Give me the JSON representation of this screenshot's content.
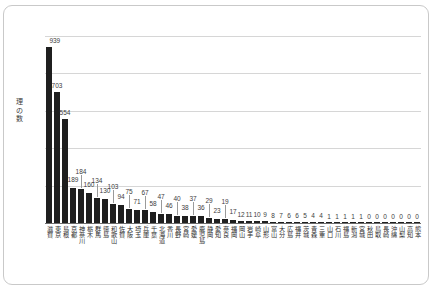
{
  "chart_data": {
    "type": "bar",
    "title": "",
    "subtitle": "",
    "xlabel": "",
    "ylabel": "理の数",
    "ylim": [
      0,
      1000
    ],
    "yticks": [
      0,
      200,
      400,
      600,
      800,
      1000
    ],
    "grid": true,
    "legend": null,
    "bar_color": "#1f1f1f",
    "categories": [
      "滋賀",
      "東京",
      "島根",
      "京都",
      "神奈川",
      "栃木",
      "群馬",
      "徳島",
      "和歌山",
      "佐賀",
      "大阪",
      "埼玉",
      "兵庫",
      "千葉",
      "北海道",
      "香川",
      "長野",
      "宮崎",
      "愛媛",
      "鹿児島",
      "静岡",
      "愛知",
      "奈良",
      "福岡",
      "岡山",
      "岩手",
      "崎阜",
      "山形",
      "富山",
      "大分",
      "広島",
      "福井",
      "茨城",
      "青森",
      "三重",
      "山口",
      "石川",
      "福島",
      "新潟",
      "宮城",
      "秋田",
      "鳥取",
      "長崎",
      "沖縄",
      "山梨",
      "高知",
      "熊本"
    ],
    "values": [
      939,
      703,
      554,
      189,
      184,
      160,
      134,
      130,
      103,
      94,
      75,
      71,
      67,
      58,
      47,
      46,
      40,
      38,
      37,
      36,
      29,
      23,
      19,
      17,
      12,
      11,
      10,
      9,
      8,
      7,
      6,
      6,
      5,
      4,
      4,
      1,
      1,
      1,
      1,
      1,
      0,
      0,
      0,
      0,
      0,
      0,
      0
    ],
    "value_labels": [
      "939",
      "703",
      "554",
      "189",
      "184",
      "160",
      "134",
      "130",
      "103",
      "94",
      "75",
      "71",
      "67",
      "58",
      "47",
      "46",
      "40",
      "38",
      "37",
      "36",
      "29",
      "23",
      "19",
      "17",
      "12",
      "11",
      "10",
      "9",
      "8",
      "7",
      "6",
      "6",
      "5",
      "4",
      "4",
      "1",
      "1",
      "1",
      "1",
      "1",
      "0",
      "0",
      "0",
      "0",
      "0",
      "0",
      "0"
    ]
  },
  "axis": {
    "y_title": "理の数",
    "y_tick_labels": [
      "1000",
      "800",
      "600",
      "400",
      "200",
      "0"
    ]
  },
  "edge_note": ""
}
